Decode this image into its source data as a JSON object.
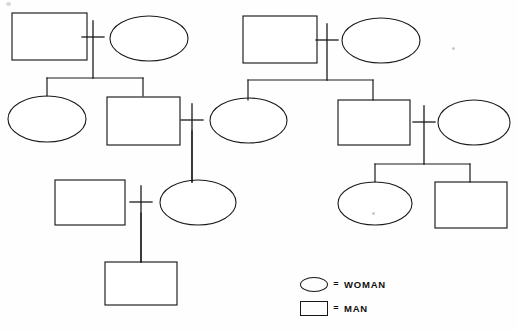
{
  "chart_data": {
    "type": "diagram",
    "title": "",
    "diagram_kind": "genealogical pedigree chart",
    "stroke_color": "#1a1a1a",
    "background_color": "#fefefe",
    "shape_semantics": {
      "ellipse": "woman",
      "rectangle": "man",
      "cross": "marriage union",
      "vertical_line": "descent line",
      "horizontal_bar": "sibling bar"
    },
    "nodes": [
      {
        "id": "L-G1-man",
        "shape": "rectangle",
        "sex": "man",
        "generation": 1,
        "family": "left",
        "x": 12,
        "y": 13,
        "w": 75,
        "h": 47,
        "label": ""
      },
      {
        "id": "L-G1-woman",
        "shape": "ellipse",
        "sex": "woman",
        "generation": 1,
        "family": "left",
        "x": 110,
        "y": 16,
        "w": 78,
        "h": 45,
        "label": ""
      },
      {
        "id": "L-G2-woman",
        "shape": "ellipse",
        "sex": "woman",
        "generation": 2,
        "family": "left",
        "x": 8,
        "y": 96,
        "w": 78,
        "h": 46,
        "label": ""
      },
      {
        "id": "L-G2-man",
        "shape": "rectangle",
        "sex": "man",
        "generation": 2,
        "family": "left",
        "x": 107,
        "y": 97,
        "w": 73,
        "h": 48,
        "label": ""
      },
      {
        "id": "L-G3-woman",
        "shape": "ellipse",
        "sex": "woman",
        "generation": 3,
        "family": "left",
        "x": 160,
        "y": 180,
        "w": 76,
        "h": 45,
        "label": ""
      },
      {
        "id": "L-G3-man",
        "shape": "rectangle",
        "sex": "man",
        "generation": 3,
        "family": "left",
        "x": 55,
        "y": 180,
        "w": 70,
        "h": 45,
        "label": ""
      },
      {
        "id": "L-G4-man",
        "shape": "rectangle",
        "sex": "man",
        "generation": 4,
        "family": "left",
        "x": 105,
        "y": 262,
        "w": 72,
        "h": 43,
        "label": ""
      },
      {
        "id": "R-G1-man",
        "shape": "rectangle",
        "sex": "man",
        "generation": 1,
        "family": "right",
        "x": 243,
        "y": 16,
        "w": 74,
        "h": 47,
        "label": ""
      },
      {
        "id": "R-G1-woman",
        "shape": "ellipse",
        "sex": "woman",
        "generation": 1,
        "family": "right",
        "x": 342,
        "y": 18,
        "w": 78,
        "h": 45,
        "label": ""
      },
      {
        "id": "R-G2-woman",
        "shape": "ellipse",
        "sex": "woman",
        "generation": 2,
        "family": "right",
        "x": 210,
        "y": 98,
        "w": 77,
        "h": 45,
        "label": ""
      },
      {
        "id": "R-G2-man",
        "shape": "rectangle",
        "sex": "man",
        "generation": 2,
        "family": "right",
        "x": 338,
        "y": 100,
        "w": 72,
        "h": 45,
        "label": ""
      },
      {
        "id": "R-G2-wife",
        "shape": "ellipse",
        "sex": "woman",
        "generation": 2,
        "family": "right",
        "x": 438,
        "y": 100,
        "w": 72,
        "h": 45,
        "label": ""
      },
      {
        "id": "R-G3-woman",
        "shape": "ellipse",
        "sex": "woman",
        "generation": 3,
        "family": "right",
        "x": 338,
        "y": 182,
        "w": 74,
        "h": 43,
        "label": ""
      },
      {
        "id": "R-G3-man",
        "shape": "rectangle",
        "sex": "man",
        "generation": 3,
        "family": "right",
        "x": 435,
        "y": 182,
        "w": 72,
        "h": 46,
        "label": ""
      }
    ],
    "unions": [
      {
        "id": "union-L1",
        "x": 93,
        "y": 37,
        "arm": 11,
        "stem_top": 21,
        "stem_bottom": 78,
        "partners": [
          "L-G1-man",
          "L-G1-woman"
        ]
      },
      {
        "id": "union-L2",
        "x": 192,
        "y": 120,
        "arm": 11,
        "stem_top": 104,
        "stem_bottom": 182,
        "partners": [
          "L-G2-man",
          "L-G3-woman"
        ]
      },
      {
        "id": "union-L3",
        "x": 141,
        "y": 202,
        "arm": 11,
        "stem_top": 186,
        "stem_bottom": 262,
        "partners": [
          "L-G3-man",
          "L-G3-woman"
        ]
      },
      {
        "id": "union-R1",
        "x": 327,
        "y": 40,
        "arm": 11,
        "stem_top": 24,
        "stem_bottom": 80,
        "partners": [
          "R-G1-man",
          "R-G1-woman"
        ]
      },
      {
        "id": "union-R2",
        "x": 424,
        "y": 122,
        "arm": 11,
        "stem_top": 106,
        "stem_bottom": 164,
        "partners": [
          "R-G2-man",
          "R-G2-wife"
        ]
      }
    ],
    "sibling_bars": [
      {
        "id": "bar-L1",
        "y": 78,
        "x_start": 47,
        "x_end": 143,
        "children": [
          "L-G2-woman",
          "L-G2-man"
        ],
        "child_drop_to": 96
      },
      {
        "id": "bar-R1",
        "y": 80,
        "x_start": 248,
        "x_end": 373,
        "children": [
          "R-G2-woman",
          "R-G2-man"
        ],
        "child_drop_to": 100
      },
      {
        "id": "bar-R2",
        "y": 164,
        "x_start": 375,
        "x_end": 470,
        "children": [
          "R-G3-woman",
          "R-G3-man"
        ],
        "child_drop_to": 182
      }
    ],
    "single_child_lines": [
      {
        "from_union": "union-L2",
        "to_node": "L-G3-woman",
        "x": 192,
        "y_start": 131,
        "y_end": 182
      },
      {
        "from_union": "union-L3",
        "to_node": "L-G4-man",
        "x": 141,
        "y_start": 213,
        "y_end": 262
      }
    ],
    "counts": {
      "men": 7,
      "women": 7,
      "total_individuals": 14,
      "unions": 5,
      "generations": 4
    }
  },
  "legend": {
    "equals_glyph": "=",
    "rows": [
      {
        "shape": "ellipse",
        "icon_name": "woman-shape-icon",
        "label": "WOMAN"
      },
      {
        "shape": "rectangle",
        "icon_name": "man-shape-icon",
        "label": "MAN"
      }
    ]
  }
}
